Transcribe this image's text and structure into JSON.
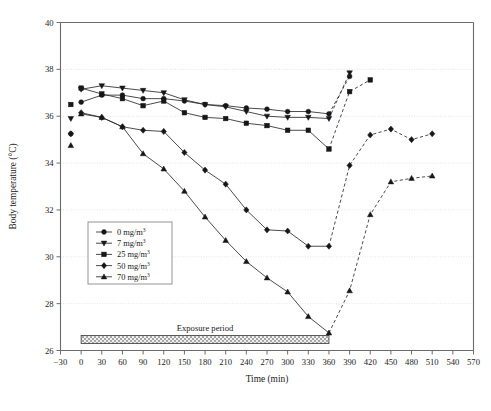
{
  "chart_data": {
    "type": "line",
    "title": "",
    "xlabel": "Time (min)",
    "ylabel": "Body temperature (°C)",
    "xlim": [
      -30,
      570
    ],
    "ylim": [
      26,
      40
    ],
    "xticks": [
      -30,
      0,
      30,
      60,
      90,
      120,
      150,
      180,
      210,
      240,
      270,
      300,
      330,
      360,
      390,
      420,
      450,
      480,
      510,
      540,
      570
    ],
    "yticks": [
      26,
      28,
      30,
      32,
      34,
      36,
      38,
      40
    ],
    "xtick_labels": [
      "−30",
      "0",
      "30",
      "60",
      "90",
      "120",
      "150",
      "180",
      "210",
      "240",
      "270",
      "300",
      "330",
      "360",
      "390",
      "420",
      "450",
      "480",
      "510",
      "540",
      "570"
    ],
    "ytick_labels": [
      "26",
      "28",
      "30",
      "32",
      "34",
      "36",
      "38",
      "40"
    ],
    "grid": true,
    "grid_axis": "y",
    "legend_position": "lower-left-inside",
    "marker_colors": "#17171a",
    "line_color": "#2b2b2b",
    "series": [
      {
        "name": "0 mg/m3",
        "label": "0 mg/m",
        "label_sup": "3",
        "marker": "circle",
        "baseline": {
          "x": -15,
          "y": 35.25
        },
        "x": [
          0,
          30,
          60,
          90,
          120,
          150,
          180,
          210,
          240,
          270,
          300,
          330,
          360,
          390
        ],
        "y": [
          36.6,
          36.9,
          36.9,
          36.75,
          36.75,
          36.65,
          36.5,
          36.45,
          36.35,
          36.3,
          36.2,
          36.2,
          36.1,
          37.7
        ]
      },
      {
        "name": "7 mg/m3",
        "label": "7 mg/m",
        "label_sup": "3",
        "marker": "triangle-down",
        "baseline": {
          "x": -15,
          "y": 35.9
        },
        "x": [
          0,
          30,
          60,
          90,
          120,
          150,
          180,
          210,
          240,
          270,
          300,
          330,
          360,
          390
        ],
        "y": [
          37.15,
          37.3,
          37.2,
          37.1,
          37.0,
          36.7,
          36.5,
          36.4,
          36.2,
          36.0,
          35.95,
          35.95,
          35.9,
          37.85
        ]
      },
      {
        "name": "25 mg/m3",
        "label": "25 mg/m",
        "label_sup": "3",
        "marker": "square",
        "baseline": {
          "x": -15,
          "y": 36.5
        },
        "x": [
          0,
          30,
          60,
          90,
          120,
          150,
          180,
          210,
          240,
          270,
          300,
          330,
          360,
          390,
          420
        ],
        "y": [
          37.2,
          36.95,
          36.75,
          36.45,
          36.65,
          36.15,
          35.95,
          35.9,
          35.7,
          35.6,
          35.4,
          35.4,
          34.6,
          37.05,
          37.55
        ]
      },
      {
        "name": "50 mg/m3",
        "label": "50 mg/m",
        "label_sup": "3",
        "marker": "diamond",
        "baseline": {
          "x": -15,
          "y": 35.25
        },
        "x": [
          0,
          30,
          60,
          90,
          120,
          150,
          180,
          210,
          240,
          270,
          300,
          330,
          360,
          390,
          420,
          450,
          480,
          510
        ],
        "y": [
          36.15,
          35.95,
          35.55,
          35.4,
          35.35,
          34.45,
          33.7,
          33.1,
          32.0,
          31.15,
          31.1,
          30.45,
          30.45,
          33.9,
          35.2,
          35.45,
          35.0,
          35.25
        ]
      },
      {
        "name": "70 mg/m3",
        "label": "70 mg/m",
        "label_sup": "3",
        "marker": "triangle-up",
        "baseline": {
          "x": -15,
          "y": 34.75
        },
        "x": [
          0,
          30,
          60,
          90,
          120,
          150,
          180,
          210,
          240,
          270,
          300,
          330,
          360,
          390,
          420,
          450,
          480,
          510
        ],
        "y": [
          36.1,
          35.95,
          35.55,
          34.4,
          33.75,
          32.8,
          31.7,
          30.7,
          29.8,
          29.1,
          28.5,
          27.45,
          26.75,
          28.55,
          31.8,
          33.2,
          33.35,
          33.45
        ]
      }
    ],
    "annotations": [
      {
        "name": "exposure-period",
        "text": "Exposure period",
        "x_start": 0,
        "x_end": 360,
        "y": 26.3
      }
    ],
    "recovery_start_x": 360,
    "dashed_after_x": 360
  },
  "legend": {
    "entries": [
      {
        "label": "0 mg/m",
        "sup": "3",
        "marker": "circle"
      },
      {
        "label": "7 mg/m",
        "sup": "3",
        "marker": "triangle-down"
      },
      {
        "label": "25 mg/m",
        "sup": "3",
        "marker": "square"
      },
      {
        "label": "50 mg/m",
        "sup": "3",
        "marker": "diamond"
      },
      {
        "label": "70 mg/m",
        "sup": "3",
        "marker": "triangle-up"
      }
    ]
  }
}
